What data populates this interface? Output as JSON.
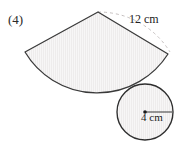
{
  "page": {
    "background_color": "#ffffff",
    "question_number": "(4)"
  },
  "figure": {
    "outline_color": "#3a3a3a",
    "fill_color": "#eceaea",
    "hatch_color": "#f6f5f5",
    "dash_color": "#b9b4b4",
    "sector": {
      "name": "circular-sector",
      "radius_label": "12 cm",
      "apex_point": "98,12",
      "left_vertex": "25,52",
      "right_vertex": "168,54",
      "radius_px": 84
    },
    "circle": {
      "name": "base-circle",
      "radius_label": "4 cm",
      "center_point": "145,112",
      "radius_px": 28,
      "radius_line_end": "172,112"
    }
  }
}
